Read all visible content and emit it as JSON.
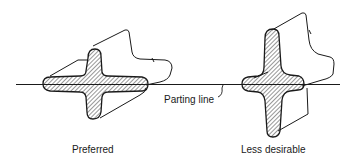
{
  "diagram": {
    "parting_line_label": "Parting line",
    "figures": [
      {
        "id": "preferred",
        "caption": "Preferred"
      },
      {
        "id": "less-desirable",
        "caption": "Less desirable"
      }
    ]
  },
  "colors": {
    "ink": "#1a1a1a",
    "background": "#ffffff"
  }
}
